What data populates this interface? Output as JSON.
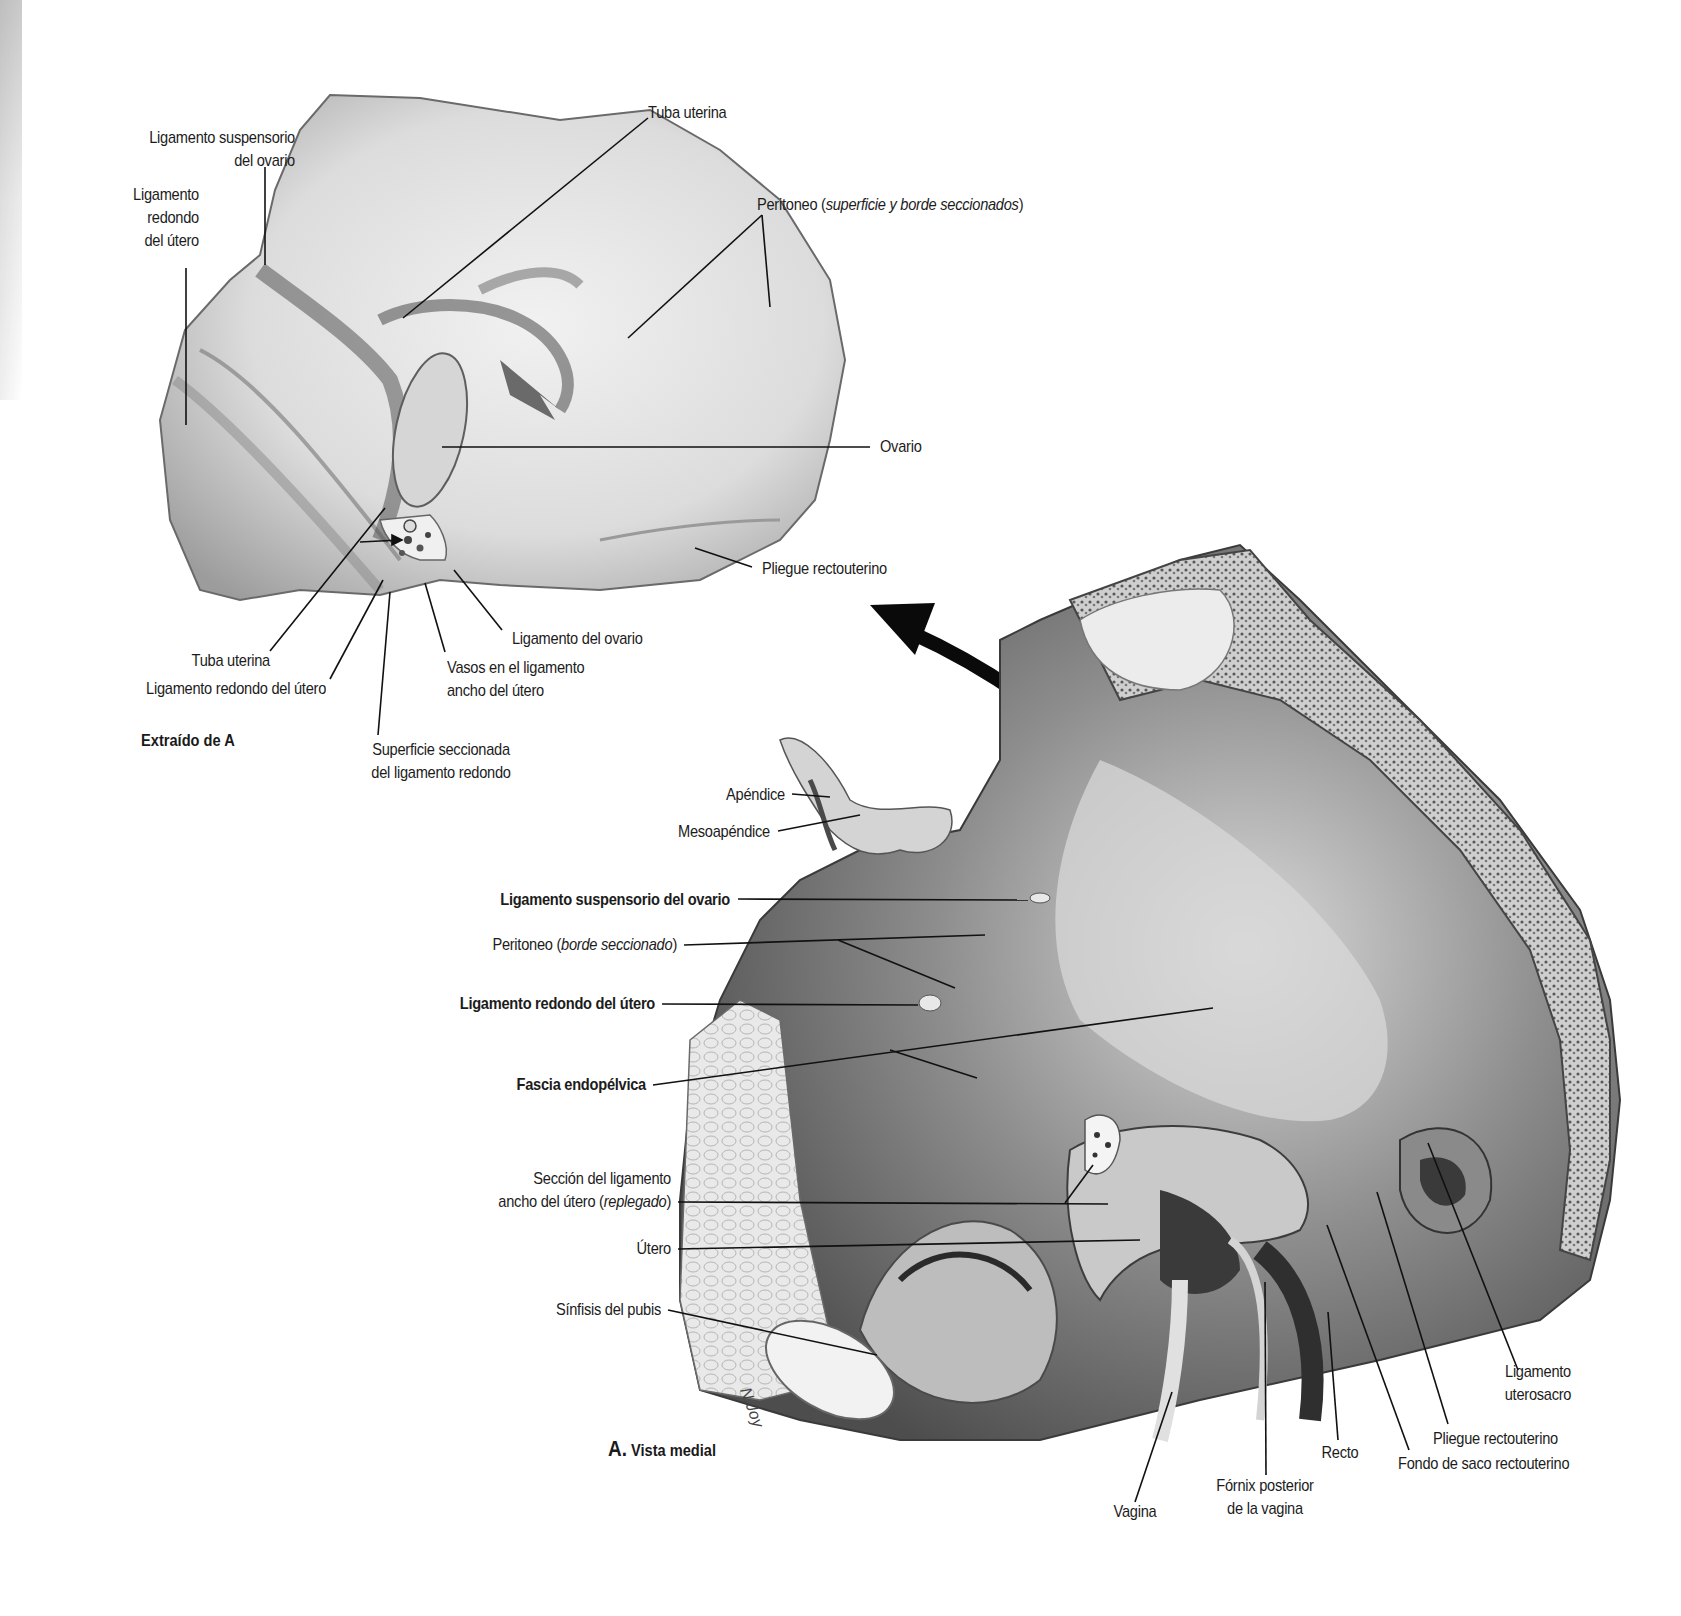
{
  "figure": {
    "inset_caption": "Extraído de A",
    "main_caption_letter": "A.",
    "main_caption_text": "Vista medial",
    "artist_initials": "N.J."
  },
  "inset_labels": {
    "lig_suspensorio": [
      "Ligamento suspensorio",
      "del ovario"
    ],
    "lig_redondo": [
      "Ligamento",
      "redondo",
      "del útero"
    ],
    "tuba_top": "Tuba uterina",
    "peritoneo": {
      "prefix": "Peritoneo (",
      "italic": "superficie y borde seccionados",
      "suffix": ")"
    },
    "ovario": "Ovario",
    "pliegue": "Pliegue rectouterino",
    "lig_ovario": "Ligamento del ovario",
    "tuba_bottom": "Tuba uterina",
    "lig_redondo_bottom": "Ligamento redondo del útero",
    "vasos": [
      "Vasos en el ligamento",
      "ancho del útero"
    ],
    "superficie": [
      "Superficie seccionada",
      "del ligamento redondo"
    ]
  },
  "main_labels": {
    "apendice": "Apéndice",
    "mesoapendice": "Mesoapéndice",
    "lig_suspensorio": "Ligamento suspensorio del ovario",
    "peritoneo": {
      "prefix": "Peritoneo (",
      "italic": "borde seccionado",
      "suffix": ")"
    },
    "lig_redondo": "Ligamento redondo del útero",
    "fascia": "Fascia endopélvica",
    "seccion": {
      "line1": "Sección del ligamento",
      "prefix": "ancho del útero (",
      "italic": "replegado",
      "suffix": ")"
    },
    "utero": "Útero",
    "sinfisis": "Sínfisis del pubis",
    "vagina": "Vagina",
    "fornix": [
      "Fórnix posterior",
      "de la vagina"
    ],
    "recto": "Recto",
    "lig_uterosacro": [
      "Ligamento",
      "uterosacro"
    ],
    "pliegue": "Pliegue rectouterino",
    "fondo": "Fondo de saco rectouterino"
  },
  "colors": {
    "ink": "#1c1c1c",
    "tissue_light": "#e6e6e6",
    "tissue_mid": "#a9a9a9",
    "tissue_dark": "#4a4a4a",
    "arrow": "#0a0a0a"
  }
}
